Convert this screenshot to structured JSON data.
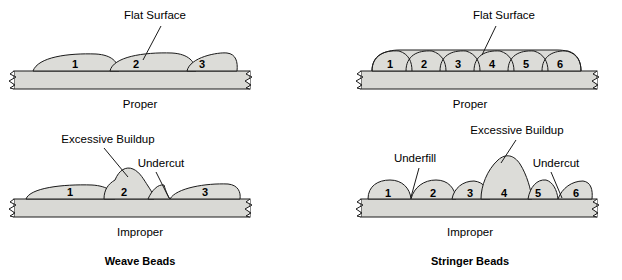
{
  "figure": {
    "cropped_header_text": "Details",
    "colors": {
      "bead_fill": "#dcdcd8",
      "plate_fill": "#d9d9d5",
      "outline": "#1a1a1a",
      "background": "#ffffff"
    }
  },
  "panels": [
    {
      "id": "weave-proper",
      "caption": "Proper",
      "bead_numbers": [
        "1",
        "2",
        "3"
      ],
      "annotations": [
        {
          "name": "flat-surface",
          "label": "Flat Surface"
        }
      ]
    },
    {
      "id": "weave-improper",
      "caption": "Improper",
      "bead_numbers": [
        "1",
        "2",
        "3"
      ],
      "annotations": [
        {
          "name": "excessive-buildup",
          "label": "Excessive Buildup"
        },
        {
          "name": "undercut",
          "label": "Undercut"
        }
      ]
    },
    {
      "id": "stringer-proper",
      "caption": "Proper",
      "bead_numbers": [
        "1",
        "2",
        "3",
        "4",
        "5",
        "6"
      ],
      "annotations": [
        {
          "name": "flat-surface",
          "label": "Flat Surface"
        }
      ]
    },
    {
      "id": "stringer-improper",
      "caption": "Improper",
      "bead_numbers": [
        "1",
        "2",
        "3",
        "4",
        "5",
        "6"
      ],
      "annotations": [
        {
          "name": "underfill",
          "label": "Underfill"
        },
        {
          "name": "excessive-buildup",
          "label": "Excessive Buildup"
        },
        {
          "name": "undercut",
          "label": "Undercut"
        }
      ]
    }
  ],
  "group_titles": {
    "left": "Weave Beads",
    "right": "Stringer Beads"
  }
}
